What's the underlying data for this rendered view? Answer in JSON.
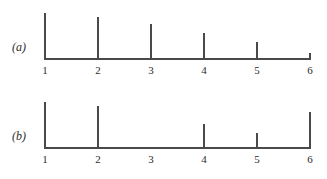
{
  "figure": {
    "panels": [
      {
        "key": "a",
        "label": "(a)",
        "tick_labels": [
          "1",
          "2",
          "3",
          "4",
          "5",
          "6"
        ]
      },
      {
        "key": "b",
        "label": "(b)",
        "tick_labels": [
          "1",
          "2",
          "3",
          "4",
          "5",
          "6"
        ]
      }
    ]
  },
  "colors": {
    "ink": "#4a4a4a",
    "text": "#2b2b2b",
    "background": "#ffffff"
  },
  "chart_data": [
    {
      "type": "bar",
      "title": "(a)",
      "subtitle": "",
      "xlabel": "",
      "ylabel": "",
      "categories": [
        "1",
        "2",
        "3",
        "4",
        "5",
        "6"
      ],
      "values": [
        42,
        38,
        32,
        24,
        16,
        6
      ],
      "ylim": [
        0,
        46
      ],
      "xlim": [
        1,
        6
      ],
      "grid": false,
      "legend": "none",
      "annotations": [
        "stem/spike plot",
        "monotone decreasing from 1 to 6"
      ]
    },
    {
      "type": "bar",
      "title": "(b)",
      "subtitle": "",
      "xlabel": "",
      "ylabel": "",
      "categories": [
        "1",
        "2",
        "3",
        "4",
        "5",
        "6"
      ],
      "values": [
        42,
        38,
        0,
        22,
        14,
        33
      ],
      "ylim": [
        0,
        46
      ],
      "xlim": [
        1,
        6
      ],
      "grid": false,
      "legend": "none",
      "annotations": [
        "stem/spike plot",
        "no spike at category 3"
      ]
    }
  ]
}
